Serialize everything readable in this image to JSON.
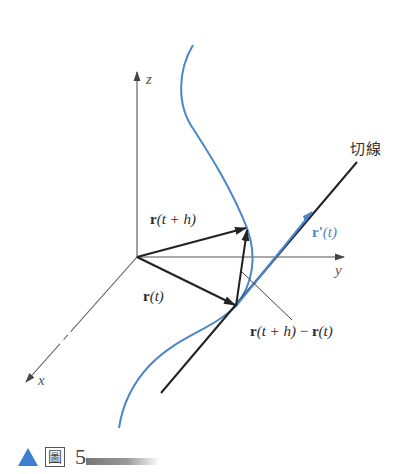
{
  "figure": {
    "axes": {
      "x": "x",
      "y": "y",
      "z": "z"
    },
    "labels": {
      "r_t_plus_h": {
        "bold": "r",
        "arg": "(t + h)"
      },
      "r_t": {
        "bold": "r",
        "arg": "(t)"
      },
      "difference": {
        "bold1": "r",
        "arg1": "(t + h)",
        "minus": " − ",
        "bold2": "r",
        "arg2": "(t)"
      },
      "derivative": {
        "bold": "r'",
        "arg": "(t)"
      },
      "tangent_line": "切線"
    },
    "colors": {
      "curve": "#4a86c8",
      "vectors": "#2a2a2a",
      "axes": "#555555",
      "caption_triangle": "#3a7fd0"
    }
  },
  "caption": {
    "glyph": "圖",
    "number": "5"
  }
}
